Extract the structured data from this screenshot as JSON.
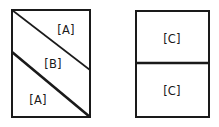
{
  "figure": {
    "title": "",
    "background_color": "#ffffff",
    "stroke_color": "#1a1a1a",
    "fill_color": "#ffffff"
  },
  "shapes": [
    {
      "id": "left-rectangle",
      "name": "left-rectangle",
      "type": "rectangle",
      "x": 12,
      "y": 10,
      "width": 78,
      "height": 107,
      "stroke_width": 2,
      "dividers": [
        {
          "id": "upper-diagonal",
          "name": "upper-diagonal-line",
          "x1": 12,
          "y1": 10,
          "x2": 90,
          "y2": 70,
          "stroke_width": 1.6
        },
        {
          "id": "lower-diagonal",
          "name": "lower-diagonal-line",
          "x1": 12,
          "y1": 52,
          "x2": 90,
          "y2": 117,
          "stroke_width": 2.6
        }
      ],
      "regions": [
        {
          "id": "left-region-top",
          "label": "[A]",
          "cx": 66,
          "cy": 29
        },
        {
          "id": "left-region-middle",
          "label": "[B]",
          "cx": 53,
          "cy": 63
        },
        {
          "id": "left-region-bottom",
          "label": "[A]",
          "cx": 38,
          "cy": 99
        }
      ]
    },
    {
      "id": "right-rectangle",
      "name": "right-rectangle",
      "type": "rectangle",
      "x": 136,
      "y": 11,
      "width": 73,
      "height": 106,
      "stroke_width": 2,
      "dividers": [
        {
          "id": "horizontal-divider",
          "name": "horizontal-divider-line",
          "x1": 136,
          "y1": 63,
          "x2": 209,
          "y2": 63,
          "stroke_width": 2.6
        }
      ],
      "regions": [
        {
          "id": "right-region-top",
          "label": "[C]",
          "cx": 172,
          "cy": 38
        },
        {
          "id": "right-region-bottom",
          "label": "[C]",
          "cx": 172,
          "cy": 90
        }
      ]
    }
  ],
  "labels": {
    "a_top": "[A]",
    "b_middle": "[B]",
    "a_bottom": "[A]",
    "c_top": "[C]",
    "c_bottom": "[C]"
  }
}
